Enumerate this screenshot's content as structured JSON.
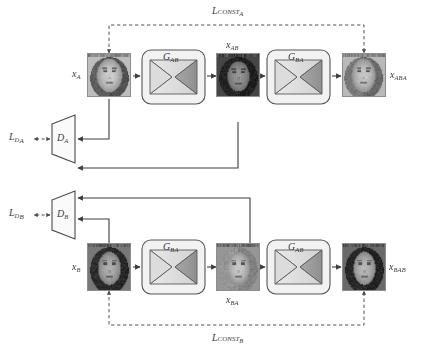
{
  "diagram": {
    "type": "flow-diagram",
    "colors": {
      "stroke": "#3d3d3d",
      "dashed": "#555555",
      "block_fill": "#f2f2f2",
      "block_stroke": "#555555",
      "bowtie_left": "#e2e2e2",
      "bowtie_right": "#9a9a9a",
      "trapezoid_fill": "#fafafa",
      "text": "#3a3a3a",
      "background": "#ffffff"
    },
    "losses": [
      {
        "id": "const-a",
        "base": "L",
        "sub": "CONST",
        "sub2": "A",
        "text": "L_CONST_A"
      },
      {
        "id": "const-b",
        "base": "L",
        "sub": "CONST",
        "sub2": "B",
        "text": "L_CONST_B"
      },
      {
        "id": "d-a",
        "base": "L",
        "sub": "D",
        "sub2": "A",
        "text": "L_D_A"
      },
      {
        "id": "d-b",
        "base": "L",
        "sub": "D",
        "sub2": "B",
        "text": "L_D_B"
      }
    ],
    "generators": [
      {
        "id": "g-ab-top",
        "base": "G",
        "sub": "AB",
        "row": "top",
        "order": 1
      },
      {
        "id": "g-ba-top",
        "base": "G",
        "sub": "BA",
        "row": "top",
        "order": 2
      },
      {
        "id": "g-ba-bottom",
        "base": "G",
        "sub": "BA",
        "row": "bottom",
        "order": 1
      },
      {
        "id": "g-ab-bottom",
        "base": "G",
        "sub": "AB",
        "row": "bottom",
        "order": 2
      }
    ],
    "discriminators": [
      {
        "id": "d-a",
        "base": "D",
        "sub": "A"
      },
      {
        "id": "d-b",
        "base": "D",
        "sub": "B"
      }
    ],
    "images": [
      {
        "id": "x-a",
        "base": "x",
        "sub": "A",
        "row": "top",
        "position": "input",
        "label_side": "left"
      },
      {
        "id": "x-ab",
        "base": "x",
        "sub": "AB",
        "row": "top",
        "position": "middle",
        "label_side": "above"
      },
      {
        "id": "x-aba",
        "base": "x",
        "sub": "ABA",
        "row": "top",
        "position": "output",
        "label_side": "right"
      },
      {
        "id": "x-b",
        "base": "x",
        "sub": "B",
        "row": "bottom",
        "position": "input",
        "label_side": "left"
      },
      {
        "id": "x-ba",
        "base": "x",
        "sub": "BA",
        "row": "bottom",
        "position": "middle",
        "label_side": "below"
      },
      {
        "id": "x-bab",
        "base": "x",
        "sub": "BAB",
        "row": "bottom",
        "position": "output",
        "label_side": "right"
      }
    ]
  }
}
